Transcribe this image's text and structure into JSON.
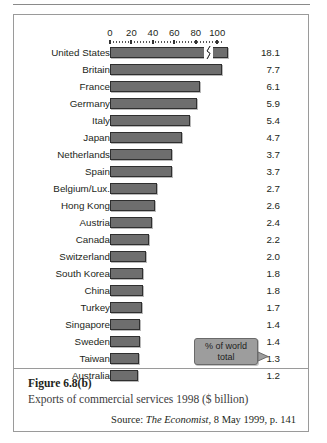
{
  "figure": {
    "number": "Figure 6.8(b)",
    "title": "Exports of commercial services 1998 ($ billion)",
    "source_prefix": "Source:",
    "source_publication": "The Economist",
    "source_suffix": ", 8 May 1999, p. 141"
  },
  "callout": {
    "line1": "% of world",
    "line2": "total"
  },
  "colors": {
    "bar_fill": "#6e6e6e",
    "bar_stroke": "#2f2f2f",
    "callout_fill": "#9d9d9d",
    "border": "#9a9a9a",
    "text": "#231f20"
  },
  "chart_data": {
    "type": "bar",
    "orientation": "horizontal",
    "title": "Exports of commercial services 1998 ($ billion)",
    "xlabel": "",
    "ylabel": "",
    "xlim": [
      0,
      110
    ],
    "xticks": [
      0,
      20,
      40,
      60,
      80,
      100
    ],
    "xtick_labels": [
      "0",
      "20",
      "40",
      "60",
      "80",
      "100"
    ],
    "grid": false,
    "legend": false,
    "axis_break": {
      "series_index": 0,
      "note": "United States bar is drawn with an axis break near 90 to fit its length"
    },
    "value_labels_note": "Right-hand column shows % of world total",
    "categories": [
      "United States",
      "Britain",
      "France",
      "Germany",
      "Italy",
      "Japan",
      "Netherlands",
      "Spain",
      "Belgium/Lux.",
      "Hong Kong",
      "Austria",
      "Canada",
      "Switzerland",
      "South Korea",
      "China",
      "Turkey",
      "Singapore",
      "Sweden",
      "Taiwan",
      "Australia"
    ],
    "values": [
      233.7,
      99.9,
      79.2,
      76.5,
      69.5,
      61.0,
      52.5,
      52.0,
      35.0,
      33.9,
      31.2,
      28.8,
      26.0,
      23.4,
      23.4,
      22.1,
      18.2,
      18.2,
      16.9,
      15.6
    ],
    "percent_of_world_total": [
      "18.1",
      "7.7",
      "6.1",
      "5.9",
      "5.4",
      "4.7",
      "3.7",
      "3.7",
      "2.7",
      "2.6",
      "2.4",
      "2.2",
      "2.0",
      "1.8",
      "1.8",
      "1.7",
      "1.4",
      "1.4",
      "1.3",
      "1.2"
    ],
    "bar_pixel_lengths": [
      118,
      112,
      90,
      87,
      80,
      72,
      62,
      62,
      47,
      45,
      42,
      39,
      36,
      33,
      33,
      32,
      30,
      30,
      29,
      28
    ]
  }
}
